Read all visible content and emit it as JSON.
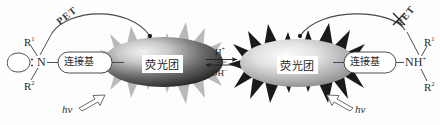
{
  "diagram": {
    "background_color": "#fdfdfd",
    "ink_color": "#2b2b2b"
  },
  "left_state": {
    "name": "free-amine-quenched-state",
    "orbital_icon": "lone-pair-lobe-icon",
    "lone_pair_icon": "lone-pair-dots-icon",
    "nitrogen_label": "N",
    "r_top_label": "R",
    "r_top_superscript": "1",
    "r_bottom_label": "R",
    "r_bottom_superscript": "2",
    "linker_label": "连接基",
    "fluorophore_label": "荧光团",
    "pet_label": "PET",
    "pet_active": true,
    "hv_label": "hv",
    "burst_color": "#b9b9b9",
    "core_color_outer": "#2f2f2f",
    "core_color_inner": "#d8d8d8"
  },
  "equilibrium": {
    "name": "acid-base-equilibrium",
    "forward_label": "H",
    "forward_superscript": "+",
    "reverse_label": "OH",
    "reverse_superscript": "−",
    "arrows_icon": "equilibrium-arrows-icon"
  },
  "right_state": {
    "name": "protonated-amine-emissive-state",
    "fluorophore_label": "荧光团",
    "linker_label": "连接基",
    "nitrogen_label": "NH",
    "nitrogen_superscript": "+",
    "r_top_label": "R",
    "r_top_superscript": "1",
    "r_bottom_label": "R",
    "r_bottom_superscript": "2",
    "pet_label": "PET",
    "pet_blocked": true,
    "block_icon": "cross-out-icon",
    "hv_label": "hv",
    "burst_color": "#1a1a1a",
    "core_color_outer": "#8d8d8d",
    "core_color_inner": "#efefef"
  }
}
